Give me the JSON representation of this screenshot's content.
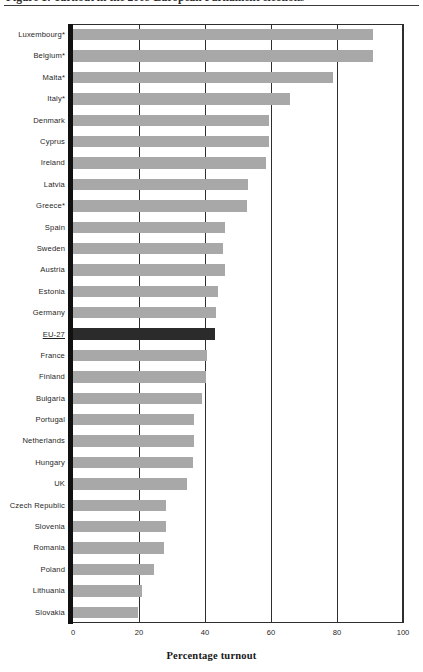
{
  "figure": {
    "caption": "Figure 1: Turnout in the 2009 European Parliament elections",
    "axis_title": "Percentage turnout"
  },
  "chart_data": {
    "type": "bar",
    "orientation": "horizontal",
    "title": "",
    "xlabel": "Percentage turnout",
    "ylabel": "",
    "xlim": [
      0,
      100
    ],
    "xticks": [
      "0",
      "20",
      "40",
      "60",
      "80",
      "100"
    ],
    "grid": "vertical gridlines at each x tick",
    "legend": "none",
    "highlight_category": "EU-27",
    "note": "Categories marked * have compulsory voting",
    "colors": {
      "bar": "#a8a8a8",
      "highlight_bar": "#2b2b2b",
      "axis": "#2e2e2e",
      "spine": "#111111",
      "background": "#ffffff"
    },
    "categories": [
      "Luxembourg*",
      "Belgium*",
      "Malta*",
      "Italy*",
      "Denmark",
      "Cyprus",
      "Ireland",
      "Latvia",
      "Greece*",
      "Spain",
      "Sweden",
      "Austria",
      "Estonia",
      "Germany",
      "EU-27",
      "France",
      "Finland",
      "Bulgaria",
      "Portugal",
      "Netherlands",
      "Hungary",
      "UK",
      "Czech Republic",
      "Slovenia",
      "Romania",
      "Poland",
      "Lithuania",
      "Slovakia"
    ],
    "values": [
      91.0,
      90.8,
      78.8,
      65.9,
      59.5,
      59.4,
      58.6,
      53.0,
      52.6,
      46.0,
      45.5,
      46.0,
      43.9,
      43.3,
      43.0,
      40.6,
      40.3,
      39.0,
      36.8,
      36.8,
      36.3,
      34.5,
      28.2,
      28.3,
      27.7,
      24.5,
      21.0,
      19.6
    ],
    "bars": [
      {
        "category": "Luxembourg*",
        "value": 91.0,
        "emphasis": false
      },
      {
        "category": "Belgium*",
        "value": 90.8,
        "emphasis": false
      },
      {
        "category": "Malta*",
        "value": 78.8,
        "emphasis": false
      },
      {
        "category": "Italy*",
        "value": 65.9,
        "emphasis": false
      },
      {
        "category": "Denmark",
        "value": 59.5,
        "emphasis": false
      },
      {
        "category": "Cyprus",
        "value": 59.4,
        "emphasis": false
      },
      {
        "category": "Ireland",
        "value": 58.6,
        "emphasis": false
      },
      {
        "category": "Latvia",
        "value": 53.0,
        "emphasis": false
      },
      {
        "category": "Greece*",
        "value": 52.6,
        "emphasis": false
      },
      {
        "category": "Spain",
        "value": 46.0,
        "emphasis": false
      },
      {
        "category": "Sweden",
        "value": 45.5,
        "emphasis": false
      },
      {
        "category": "Austria",
        "value": 46.0,
        "emphasis": false
      },
      {
        "category": "Estonia",
        "value": 43.9,
        "emphasis": false
      },
      {
        "category": "Germany",
        "value": 43.3,
        "emphasis": false
      },
      {
        "category": "EU-27",
        "value": 43.0,
        "emphasis": true
      },
      {
        "category": "France",
        "value": 40.6,
        "emphasis": false
      },
      {
        "category": "Finland",
        "value": 40.3,
        "emphasis": false
      },
      {
        "category": "Bulgaria",
        "value": 39.0,
        "emphasis": false
      },
      {
        "category": "Portugal",
        "value": 36.8,
        "emphasis": false
      },
      {
        "category": "Netherlands",
        "value": 36.8,
        "emphasis": false
      },
      {
        "category": "Hungary",
        "value": 36.3,
        "emphasis": false
      },
      {
        "category": "UK",
        "value": 34.5,
        "emphasis": false
      },
      {
        "category": "Czech Republic",
        "value": 28.2,
        "emphasis": false
      },
      {
        "category": "Slovenia",
        "value": 28.3,
        "emphasis": false
      },
      {
        "category": "Romania",
        "value": 27.7,
        "emphasis": false
      },
      {
        "category": "Poland",
        "value": 24.5,
        "emphasis": false
      },
      {
        "category": "Lithuania",
        "value": 21.0,
        "emphasis": false
      },
      {
        "category": "Slovakia",
        "value": 19.6,
        "emphasis": false
      }
    ]
  }
}
